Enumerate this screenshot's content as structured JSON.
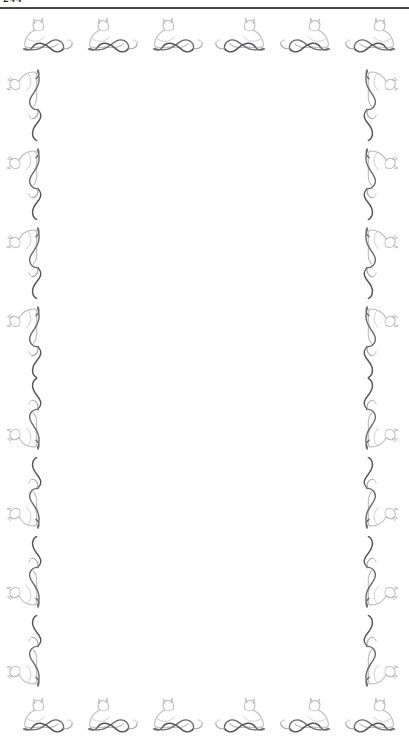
{
  "document": {
    "title": "Ornamental Border Page",
    "page_type": "blank-bordered-page",
    "background_color": "#ffffff",
    "width_px": 409,
    "height_px": 742
  },
  "header": {
    "folio_text": "244",
    "folio_note": "page number clipped by top crop",
    "rule_color": "#2e2e2e",
    "rule_visible": true
  },
  "body": {
    "content_text": "",
    "content_note": "page interior is blank"
  },
  "ornament": {
    "motif_name": "reclining-cat-sphinx",
    "style": "art-nouveau-line-drawing",
    "outline_color": "#b9b9bd",
    "accent_color": "#4a4a4e",
    "stroke_width": 1.1
  },
  "borders": {
    "top": {
      "name": "top-border",
      "count": 6,
      "orientation": "horizontal",
      "cell_width": 65,
      "cell_height": 44,
      "start_x": 14,
      "items": [
        {
          "index": 1,
          "x": 14,
          "mirrored": false
        },
        {
          "index": 2,
          "x": 79,
          "mirrored": false
        },
        {
          "index": 3,
          "x": 144,
          "mirrored": false
        },
        {
          "index": 4,
          "x": 209,
          "mirrored": true
        },
        {
          "index": 5,
          "x": 274,
          "mirrored": true
        },
        {
          "index": 6,
          "x": 339,
          "mirrored": true
        }
      ]
    },
    "bottom": {
      "name": "bottom-border",
      "count": 6,
      "orientation": "horizontal",
      "cell_width": 65,
      "cell_height": 44,
      "start_x": 14,
      "items": [
        {
          "index": 1,
          "x": 14,
          "mirrored": false
        },
        {
          "index": 2,
          "x": 79,
          "mirrored": false
        },
        {
          "index": 3,
          "x": 144,
          "mirrored": false
        },
        {
          "index": 4,
          "x": 209,
          "mirrored": true
        },
        {
          "index": 5,
          "x": 274,
          "mirrored": true
        },
        {
          "index": 6,
          "x": 339,
          "mirrored": true
        }
      ]
    },
    "left": {
      "name": "left-border",
      "count": 8,
      "orientation": "vertical",
      "cell_width": 46,
      "cell_height": 79,
      "start_y": 62,
      "items": [
        {
          "index": 1,
          "y": 0,
          "flipped_vertically": false
        },
        {
          "index": 2,
          "y": 79,
          "flipped_vertically": false
        },
        {
          "index": 3,
          "y": 158,
          "flipped_vertically": false
        },
        {
          "index": 4,
          "y": 237,
          "flipped_vertically": false
        },
        {
          "index": 5,
          "y": 316,
          "flipped_vertically": true
        },
        {
          "index": 6,
          "y": 395,
          "flipped_vertically": true
        },
        {
          "index": 7,
          "y": 474,
          "flipped_vertically": true
        },
        {
          "index": 8,
          "y": 553,
          "flipped_vertically": true
        }
      ]
    },
    "right": {
      "name": "right-border",
      "count": 8,
      "orientation": "vertical",
      "mirrored_horizontally": true,
      "cell_width": 46,
      "cell_height": 79,
      "start_y": 62,
      "items": [
        {
          "index": 1,
          "y": 0,
          "flipped_vertically": false
        },
        {
          "index": 2,
          "y": 79,
          "flipped_vertically": false
        },
        {
          "index": 3,
          "y": 158,
          "flipped_vertically": false
        },
        {
          "index": 4,
          "y": 237,
          "flipped_vertically": false
        },
        {
          "index": 5,
          "y": 316,
          "flipped_vertically": true
        },
        {
          "index": 6,
          "y": 395,
          "flipped_vertically": true
        },
        {
          "index": 7,
          "y": 474,
          "flipped_vertically": true
        },
        {
          "index": 8,
          "y": 553,
          "flipped_vertically": true
        }
      ]
    }
  }
}
